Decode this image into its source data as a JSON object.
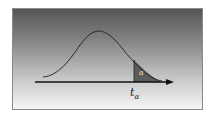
{
  "diagram": {
    "type": "t-distribution-right-tail",
    "tail_label": "α",
    "critical_value_label": "t",
    "critical_value_subscript": "α",
    "colors": {
      "background_top": "#555555",
      "background_bottom": "#f6f6f6",
      "curve": "#2a2a2a",
      "shaded_tail": "#4a4a4a",
      "axis": "#111111"
    }
  }
}
